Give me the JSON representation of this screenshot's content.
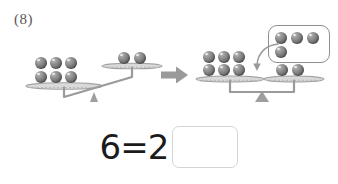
{
  "problem": {
    "number_label": "(8)"
  },
  "colors": {
    "ball_fill": "#7a7a7a",
    "ball_highlight": "#b9b9b9",
    "scale_stroke": "#9a9a9a",
    "fulcrum_fill": "#9e9e9e",
    "arrow_fill": "#9a9a9a",
    "box_stroke": "#8f8f8f",
    "answer_box_stroke": "#d2d6d8",
    "equation_text": "#1b1b1b",
    "problem_number_text": "#5a5a5a",
    "background": "#ffffff"
  },
  "diagram": {
    "left_scale": {
      "name": "unbalanced-scale",
      "state": "tilted-left",
      "left_pan": {
        "ball_count": 6,
        "rows": [
          3,
          3
        ]
      },
      "right_pan": {
        "ball_count": 2,
        "rows": [
          2
        ]
      }
    },
    "transform_arrow": {
      "name": "right-arrow",
      "glyph": "→"
    },
    "right_scale": {
      "name": "balanced-scale",
      "state": "level",
      "left_pan": {
        "ball_count": 6,
        "rows": [
          3,
          3
        ]
      },
      "right_pan": {
        "ball_count": 2,
        "rows": [
          2
        ]
      }
    },
    "ball_box": {
      "name": "added-balls-group",
      "ball_count": 4,
      "rows": [
        3,
        1
      ]
    },
    "drop_arrow": {
      "name": "curved-down-arrow",
      "direction": "down-left"
    }
  },
  "equation": {
    "expression": "6=2",
    "left_operand": "6",
    "operator": "=",
    "right_operand": "2",
    "answer_value": "",
    "answer_placeholder": ""
  }
}
